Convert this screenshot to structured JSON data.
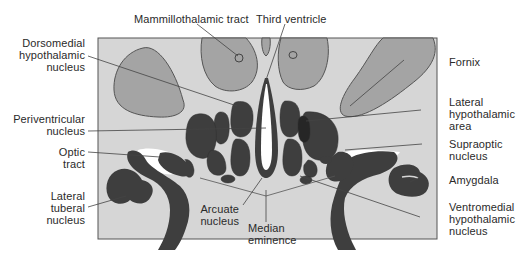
{
  "figure": {
    "type": "anatomical cross-section of hypothalamus",
    "colors": {
      "background_panel": "#d6d6d6",
      "light_structure": "#a4a4a4",
      "dark_nucleus": "#3e3e3e",
      "white_space": "#ffffff",
      "outline": "#555555",
      "leader_line": "#444444",
      "text": "#2a2a2a"
    },
    "labels": {
      "mammillothalamic_tract": "Mammillothalamic tract",
      "third_ventricle": "Third ventricle",
      "dorsomedial_1": "Dorsomedial",
      "dorsomedial_2": "hypothalamic",
      "dorsomedial_3": "nucleus",
      "periventricular_1": "Periventricular",
      "periventricular_2": "nucleus",
      "optic_1": "Optic",
      "optic_2": "tract",
      "lateral_tuberal_1": "Lateral",
      "lateral_tuberal_2": "tuberal",
      "lateral_tuberal_3": "nucleus",
      "arcuate_1": "Arcuate",
      "arcuate_2": "nucleus",
      "median_1": "Median",
      "median_2": "eminence",
      "fornix": "Fornix",
      "lateral_hypo_1": "Lateral",
      "lateral_hypo_2": "hypothalamic",
      "lateral_hypo_3": "area",
      "supraoptic_1": "Supraoptic",
      "supraoptic_2": "nucleus",
      "amygdala": "Amygdala",
      "ventromedial_1": "Ventromedial",
      "ventromedial_2": "hypothalamic",
      "ventromedial_3": "nucleus"
    }
  }
}
